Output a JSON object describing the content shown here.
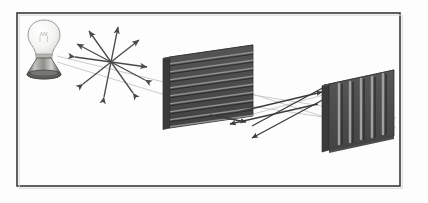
{
  "figure": {
    "background_color": "#fdfdfd",
    "frame": {
      "name": "diagram-border",
      "x": 17,
      "y": 13,
      "width": 383,
      "height": 173,
      "stroke_color": "#3a3a3a",
      "stroke_width": 1.6,
      "fill": "#fdfdfd"
    },
    "light_source": {
      "label": "light-bulb",
      "glass_color": "#f2f2f0",
      "glass_outline": "#9a9a98",
      "base_color": "#6e6e6c",
      "base_highlight": "#c9c9c6",
      "center_x": 44,
      "center_y": 40
    },
    "unpolarized_star": {
      "label": "unpolarized-light-vibration-arrows",
      "center_x": 111,
      "center_y": 62,
      "arrow_color": "#555555",
      "arrow_count": 5,
      "description": "five double-headed arrows radiating in all directions representing randomly oriented electric field vibrations",
      "angles_deg": [
        8,
        52,
        84,
        126,
        160
      ],
      "length": 36
    },
    "polarizer_one": {
      "label": "first-polarizer-horizontal-slits",
      "orientation": "horizontal",
      "slit_count": 9,
      "face_color": "#4b4b4b",
      "edge_color": "#636363",
      "side_color": "#3a3a3a",
      "slit_color": "#8e8e8e",
      "x": 163,
      "y": 45,
      "width": 90,
      "height": 82
    },
    "polarizer_two": {
      "label": "second-polarizer-vertical-slits",
      "orientation": "vertical",
      "slit_count": 5,
      "face_color": "#4b4b4b",
      "edge_color": "#6a6a6a",
      "side_color": "#3a3a3a",
      "slit_color": "#9a9a9a",
      "x": 322,
      "y": 70,
      "width": 72,
      "height": 80
    },
    "rays": {
      "label": "light-ray-lines",
      "color": "#c2c2c2",
      "width": 0.9,
      "count": 4
    },
    "polarized_arrows": {
      "label": "polarized-light-arrows-between-polarizers",
      "color": "#3b3b3b",
      "count": 4,
      "description": "double-headed horizontal arrows between the two polarizers indicating linearly polarized vibration direction"
    }
  }
}
